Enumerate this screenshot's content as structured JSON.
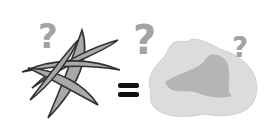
{
  "illustration": {
    "left_item": "pea-pods",
    "operator": "=",
    "right_item": "puddle",
    "question_marks": [
      "?",
      "?",
      "?"
    ],
    "colors": {
      "pod_fill": "#a9a9a9",
      "pod_stroke": "#333333",
      "question_mark": "#a3a3a3",
      "puddle_light": "#dcdcdc",
      "puddle_dark": "#b5b5b5",
      "equals": "#111111"
    }
  }
}
